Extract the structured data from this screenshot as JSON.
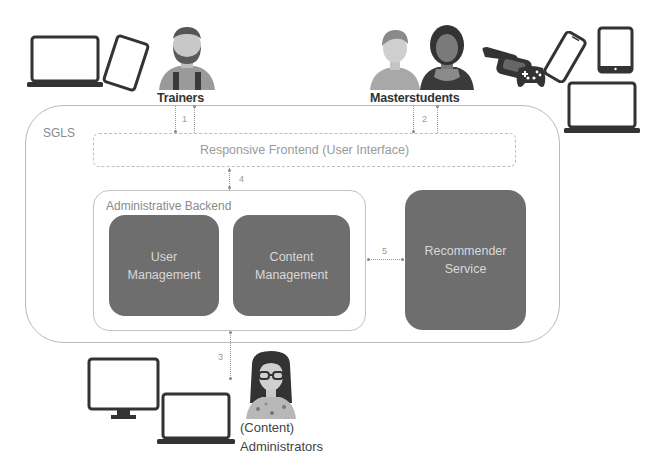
{
  "system": {
    "name": "SGLS",
    "frontend": {
      "label": "Responsive Frontend (User Interface)"
    },
    "backend": {
      "label": "Administrative Backend",
      "modules": [
        {
          "line1": "User",
          "line2": "Management"
        },
        {
          "line1": "Content",
          "line2": "Management"
        }
      ]
    },
    "recommender": {
      "line1": "Recommender",
      "line2": "Service"
    }
  },
  "actors": {
    "trainers": {
      "label": "Trainers",
      "devices": [
        "laptop-icon",
        "tablet-icon"
      ]
    },
    "masterstudents": {
      "label": "Masterstudents",
      "devices": [
        "vr-headset-icon",
        "gamepad-icon",
        "smartphone-icon",
        "tablet-icon",
        "laptop-icon"
      ]
    },
    "administrators": {
      "line1": "(Content)",
      "line2": "Administrators",
      "devices": [
        "monitor-icon",
        "laptop-icon"
      ]
    }
  },
  "links": [
    {
      "id": "1",
      "label": "1",
      "from": "Trainers",
      "to": "Responsive Frontend"
    },
    {
      "id": "2",
      "label": "2",
      "from": "Masterstudents",
      "to": "Responsive Frontend"
    },
    {
      "id": "3",
      "label": "3",
      "from": "Administrative Backend",
      "to": "(Content) Administrators"
    },
    {
      "id": "4",
      "label": "4",
      "from": "Responsive Frontend",
      "to": "Administrative Backend"
    },
    {
      "id": "5",
      "label": "5",
      "from": "Administrative Backend",
      "to": "Recommender Service"
    }
  ],
  "colors": {
    "module_fill": "#6e6e6e",
    "module_text": "#d8d8d8",
    "border": "#b9b9b9",
    "icon": "#333333"
  }
}
